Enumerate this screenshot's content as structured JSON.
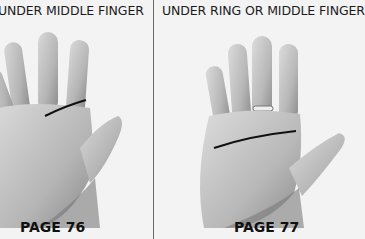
{
  "panels": [
    {
      "caption": "UNDER MIDDLE FINGER",
      "page_ref": "PAGE 76",
      "image": "hand-palm-illustration-with-line",
      "line_color": "#111111"
    },
    {
      "caption": "UNDER RING OR MIDDLE FINGER",
      "page_ref": "PAGE 77",
      "image": "hand-palm-illustration-with-ring-and-line",
      "line_color": "#111111"
    }
  ]
}
